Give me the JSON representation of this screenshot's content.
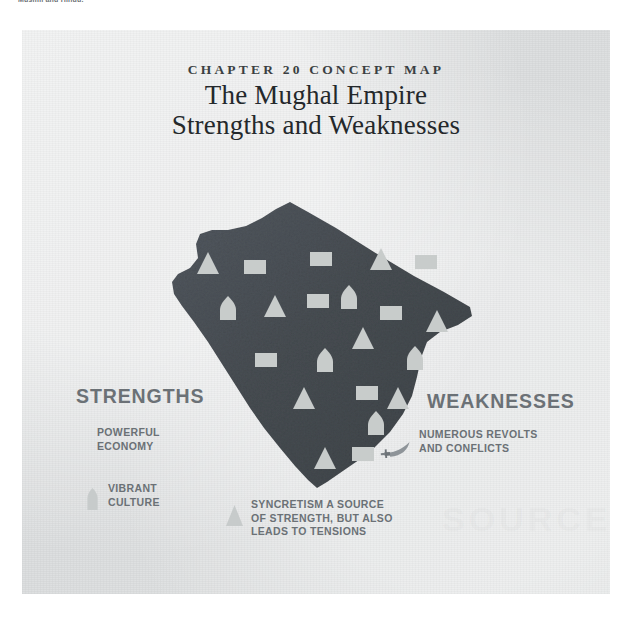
{
  "page": {
    "caption_top": "Muslim and Hindu.",
    "background_color": "#ffffff",
    "panel_color": "#dfe1e2"
  },
  "figure": {
    "eyebrow": "CHAPTER 20 CONCEPT MAP",
    "title_line_1": "The Mughal Empire",
    "title_line_2": "Strengths and Weaknesses",
    "watermark": "SOURCE"
  },
  "map": {
    "name": "mughal-empire-territory",
    "fill_color": "#4a5055",
    "symbol_color": "#c8cccb",
    "symbols": [
      {
        "type": "square",
        "x": 299,
        "y": 229
      },
      {
        "type": "triangle",
        "x": 186,
        "y": 234
      },
      {
        "type": "square",
        "x": 233,
        "y": 237
      },
      {
        "type": "triangle",
        "x": 359,
        "y": 230
      },
      {
        "type": "square",
        "x": 404,
        "y": 232
      },
      {
        "type": "dome",
        "x": 206,
        "y": 279
      },
      {
        "type": "triangle",
        "x": 253,
        "y": 277
      },
      {
        "type": "square",
        "x": 296,
        "y": 271
      },
      {
        "type": "dome",
        "x": 327,
        "y": 268
      },
      {
        "type": "square",
        "x": 369,
        "y": 283
      },
      {
        "type": "triangle",
        "x": 415,
        "y": 292
      },
      {
        "type": "triangle",
        "x": 341,
        "y": 309
      },
      {
        "type": "square",
        "x": 244,
        "y": 330
      },
      {
        "type": "dome",
        "x": 303,
        "y": 331
      },
      {
        "type": "dome",
        "x": 393,
        "y": 329
      },
      {
        "type": "triangle",
        "x": 282,
        "y": 369
      },
      {
        "type": "square",
        "x": 345,
        "y": 363
      },
      {
        "type": "triangle",
        "x": 376,
        "y": 369
      },
      {
        "type": "dome",
        "x": 354,
        "y": 394
      },
      {
        "type": "triangle",
        "x": 303,
        "y": 429
      },
      {
        "type": "square",
        "x": 341,
        "y": 424
      }
    ]
  },
  "strengths": {
    "heading": "STRENGTHS",
    "items": [
      {
        "icon": "square-icon",
        "label": "POWERFUL\nECONOMY"
      },
      {
        "icon": "dome-icon",
        "label": "VIBRANT\nCULTURE"
      }
    ]
  },
  "weaknesses": {
    "heading": "WEAKNESSES",
    "items": [
      {
        "icon": "sword-icon",
        "label": "NUMEROUS REVOLTS\nAND CONFLICTS"
      }
    ]
  },
  "shared": {
    "items": [
      {
        "icon": "triangle-icon",
        "label": "SYNCRETISM A SOURCE\nOF STRENGTH, BUT ALSO\nLEADS TO TENSIONS"
      }
    ]
  }
}
